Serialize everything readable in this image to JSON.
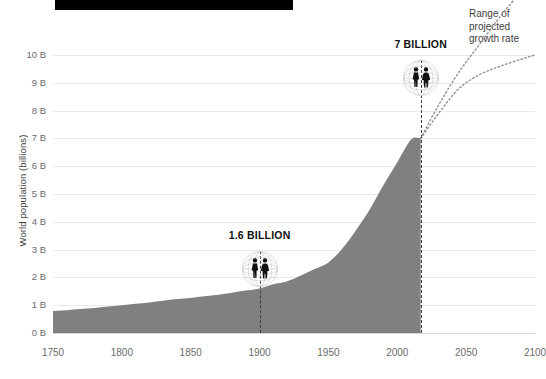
{
  "title_bar": {
    "redacted": true
  },
  "axes": {
    "y_title": "World population (billions)",
    "y_ticks": [
      "0 B",
      "1 B",
      "2 B",
      "3 B",
      "4 B",
      "5 B",
      "6 B",
      "7 B",
      "8 B",
      "9 B",
      "10 B"
    ],
    "x_ticks": [
      "1750",
      "1800",
      "1850",
      "1900",
      "1950",
      "2000",
      "2050",
      "2100"
    ]
  },
  "annotations": {
    "milestone_1": {
      "label": "1.6 BILLION",
      "year": 1900,
      "value": 1.6,
      "icon": "globe-people-icon"
    },
    "milestone_2": {
      "label": "7 BILLION",
      "year": 2017,
      "value": 7.0,
      "icon": "globe-people-icon"
    },
    "projection_note": {
      "line1": "Range of",
      "line2": "projected",
      "line3": "growth rate"
    }
  },
  "colors": {
    "area_fill": "#808080",
    "gridline": "#e9e9e9",
    "axis_text": "#6b6b6b",
    "annotation_text": "#111111",
    "marker_line": "#3a3a3a",
    "projection_line": "#9a9a9a",
    "title_bar": "#000000"
  },
  "chart_data": {
    "type": "area",
    "title": "",
    "xlabel": "",
    "ylabel": "World population (billions)",
    "xlim": [
      1750,
      2100
    ],
    "ylim": [
      0,
      10
    ],
    "grid": true,
    "legend": "none",
    "x": [
      1750,
      1760,
      1770,
      1780,
      1790,
      1800,
      1810,
      1820,
      1830,
      1840,
      1850,
      1860,
      1870,
      1880,
      1890,
      1900,
      1910,
      1920,
      1930,
      1940,
      1950,
      1960,
      1970,
      1980,
      1990,
      2000,
      2010,
      2017
    ],
    "values": [
      0.79,
      0.82,
      0.86,
      0.9,
      0.95,
      1.0,
      1.05,
      1.1,
      1.16,
      1.22,
      1.26,
      1.32,
      1.38,
      1.45,
      1.53,
      1.6,
      1.75,
      1.86,
      2.07,
      2.3,
      2.54,
      3.03,
      3.7,
      4.44,
      5.32,
      6.14,
      6.96,
      7.55
    ],
    "series": [
      {
        "name": "World population (historical)",
        "style": "area",
        "values": [
          0.79,
          0.82,
          0.86,
          0.9,
          0.95,
          1.0,
          1.05,
          1.1,
          1.16,
          1.22,
          1.26,
          1.32,
          1.38,
          1.45,
          1.53,
          1.6,
          1.75,
          1.86,
          2.07,
          2.3,
          2.54,
          3.03,
          3.7,
          4.44,
          5.32,
          6.14,
          6.96,
          7.0
        ]
      },
      {
        "name": "Projected growth rate (high)",
        "style": "dotted-line",
        "x": [
          2017,
          2030,
          2045,
          2060,
          2075,
          2090,
          2100
        ],
        "values": [
          7.0,
          8.2,
          9.4,
          10.4,
          11.4,
          12.3,
          13.0
        ]
      },
      {
        "name": "Projected growth rate (low)",
        "style": "dotted-line",
        "x": [
          2017,
          2030,
          2045,
          2060,
          2075,
          2090,
          2100
        ],
        "values": [
          7.0,
          7.9,
          8.8,
          9.3,
          9.6,
          9.85,
          10.0
        ]
      }
    ],
    "annotations": [
      {
        "text": "1.6 BILLION",
        "x": 1900,
        "y": 1.6
      },
      {
        "text": "7 BILLION",
        "x": 2017,
        "y": 7.0
      },
      {
        "text": "Range of projected growth rate",
        "x": 2075,
        "y": 9.6
      }
    ]
  }
}
